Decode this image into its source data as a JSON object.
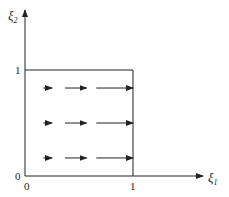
{
  "diagram": {
    "axes": {
      "x_label": "ξ",
      "x_sub": "1",
      "y_label": "ξ",
      "y_sub": "2",
      "origin_x_tick": "0",
      "origin_y_tick": "0",
      "x_tick": "1",
      "y_tick": "1"
    },
    "colors": {
      "stroke": "#222222",
      "background": "#ffffff"
    },
    "rows": [
      {
        "y": 0.83,
        "arrows": [
          {
            "x0": 0.17,
            "x1": 0.25
          },
          {
            "x0": 0.37,
            "x1": 0.57
          },
          {
            "x0": 0.66,
            "x1": 1.0
          }
        ]
      },
      {
        "y": 0.5,
        "arrows": [
          {
            "x0": 0.17,
            "x1": 0.25
          },
          {
            "x0": 0.37,
            "x1": 0.57
          },
          {
            "x0": 0.66,
            "x1": 1.0
          }
        ]
      },
      {
        "y": 0.17,
        "arrows": [
          {
            "x0": 0.17,
            "x1": 0.25
          },
          {
            "x0": 0.37,
            "x1": 0.57
          },
          {
            "x0": 0.66,
            "x1": 1.0
          }
        ]
      }
    ]
  }
}
